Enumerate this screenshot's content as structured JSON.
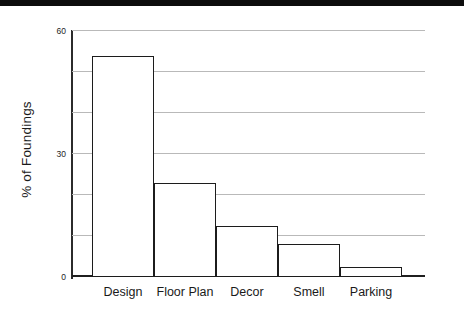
{
  "figure": {
    "y_axis_title": "% of Foundings",
    "scan_artifact_color": "#0d0d0d",
    "bar_outline_color": "#1c1c1c",
    "gridline_color": "#b9b9b9",
    "axis_color": "#2b2b2b"
  },
  "chart_data": {
    "type": "bar",
    "title": "",
    "xlabel": "",
    "ylabel": "% of Foundings",
    "categories": [
      "Design",
      "Floor Plan",
      "Decor",
      "Smell",
      "Parking"
    ],
    "values": [
      54,
      23,
      12.5,
      8,
      2.5
    ],
    "ylim": [
      0,
      60
    ],
    "yticks": [
      0,
      10,
      20,
      30,
      40,
      50,
      60
    ],
    "ytick_labels_shown": [
      "0",
      "30",
      "60"
    ],
    "grid": true,
    "grid_axis": "y",
    "legend": "none",
    "bar_fill": "none",
    "bar_edge": "#1c1c1c"
  }
}
